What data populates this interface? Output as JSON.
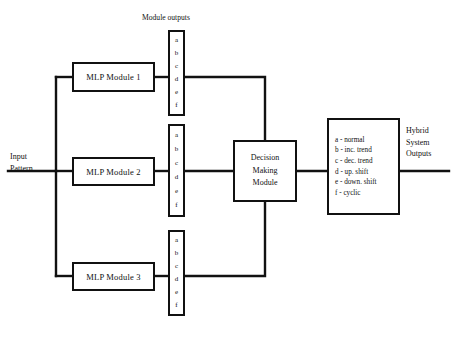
{
  "diagram": {
    "title": "Module outputs",
    "input_label": {
      "line1": "Input",
      "line2": "Pattern"
    },
    "output_label": {
      "line1": "Hybrid",
      "line2": "System",
      "line3": "Outputs"
    },
    "modules": [
      {
        "label": "MLP Module 1"
      },
      {
        "label": "MLP Module 2"
      },
      {
        "label": "MLP Module 3"
      }
    ],
    "output_letters": [
      "a",
      "b",
      "c",
      "d",
      "e",
      "f"
    ],
    "decision": {
      "line1": "Decision",
      "line2": "Making",
      "line3": "Module"
    },
    "legend": [
      "a - normal",
      "b - inc. trend",
      "c - dec. trend",
      "d - up. shift",
      "e - down. shift",
      "f - cyclic"
    ],
    "colors": {
      "stroke": "#111111",
      "background": "#ffffff"
    }
  }
}
